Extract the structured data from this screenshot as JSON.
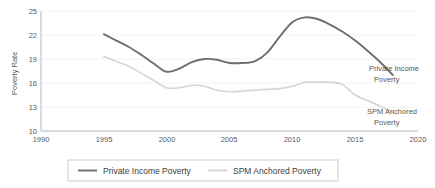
{
  "chart_data": {
    "type": "line",
    "title": "",
    "xlabel": "",
    "ylabel": "Poverty Rate",
    "xlim": [
      1990,
      2020
    ],
    "ylim": [
      10,
      25
    ],
    "xticks": [
      1990,
      1995,
      2000,
      2005,
      2010,
      2015,
      2020
    ],
    "yticks": [
      10,
      13,
      16,
      19,
      22,
      25
    ],
    "grid": true,
    "legend_position": "bottom",
    "x": [
      1995,
      1996,
      1997,
      1998,
      1999,
      2000,
      2001,
      2002,
      2003,
      2004,
      2005,
      2006,
      2007,
      2008,
      2009,
      2010,
      2011,
      2012,
      2013,
      2014,
      2015,
      2016,
      2017,
      2018
    ],
    "series": [
      {
        "name": "Private Income  Poverty",
        "color": "#6e6e6e",
        "values": [
          22.1,
          21.3,
          20.5,
          19.5,
          18.4,
          17.4,
          17.8,
          18.6,
          19.0,
          18.9,
          18.5,
          18.5,
          18.7,
          19.8,
          21.8,
          23.6,
          24.2,
          24.0,
          23.3,
          22.4,
          21.3,
          20.0,
          18.6,
          17.0
        ]
      },
      {
        "name": "SPM Anchored Poverty",
        "color": "#d4d4d4",
        "values": [
          19.3,
          18.7,
          18.1,
          17.2,
          16.3,
          15.4,
          15.4,
          15.7,
          15.6,
          15.1,
          14.9,
          15.0,
          15.1,
          15.2,
          15.3,
          15.6,
          16.1,
          16.1,
          16.1,
          15.8,
          14.5,
          13.8,
          13.1,
          12.3
        ]
      }
    ]
  },
  "annotations": [
    {
      "name": "private-income-poverty",
      "line1": "Private Income",
      "line2": "Poverty"
    },
    {
      "name": "spm-anchored-poverty",
      "line1": "SPM Anchored",
      "line2": "Poverty"
    }
  ],
  "legend": {
    "items": [
      {
        "label": "Private Income  Poverty",
        "color": "#6e6e6e"
      },
      {
        "label": "SPM Anchored Poverty",
        "color": "#d4d4d4"
      }
    ]
  },
  "axis": {
    "y_title": "Poverty Rate",
    "y_tick_labels": [
      "25",
      "22",
      "19",
      "16",
      "13",
      "10"
    ],
    "x_tick_labels": [
      "1990",
      "1995",
      "2000",
      "2005",
      "2010",
      "2015",
      "2020"
    ]
  },
  "colors": {
    "series_dark": "#6e6e6e",
    "series_light": "#d4d4d4",
    "grid": "#ededed",
    "axis": "#a6a6a6",
    "text": "#595959"
  }
}
